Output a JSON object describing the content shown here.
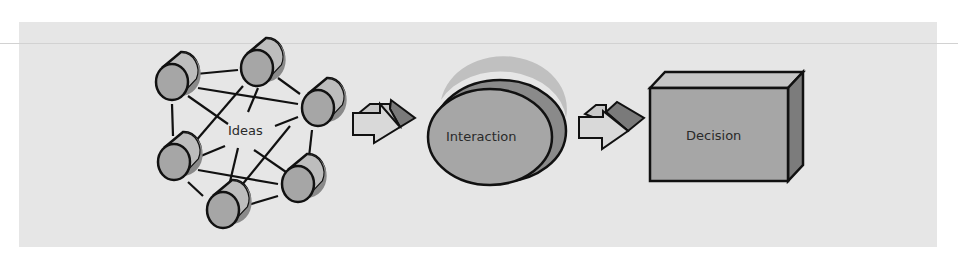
{
  "diagram": {
    "stages": [
      {
        "id": "ideas",
        "label": "Ideas",
        "shape": "network-of-cylinders",
        "count": 6
      },
      {
        "id": "interaction",
        "label": "Interaction",
        "shape": "3d-ellipse"
      },
      {
        "id": "decision",
        "label": "Decision",
        "shape": "3d-box"
      }
    ],
    "connectors": [
      {
        "from": "ideas",
        "to": "interaction",
        "icon": "right-arrow-3d-icon"
      },
      {
        "from": "interaction",
        "to": "decision",
        "icon": "right-arrow-3d-icon"
      }
    ],
    "colors": {
      "background": "#e6e6e6",
      "shape_fill": "#a8a8a8",
      "shape_light": "#c4c4c4",
      "shape_dark": "#7e7e7e",
      "outline": "#111111"
    }
  }
}
